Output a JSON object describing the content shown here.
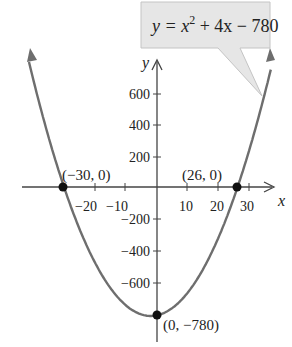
{
  "chart_data": {
    "type": "line",
    "title": "",
    "equation": "y = x^2 + 4x - 780",
    "callout": {
      "prefix": "y = x",
      "exp": "2",
      "suffix": " + 4x − 780"
    },
    "xlabel": "x",
    "ylabel": "y",
    "xlim": [
      -40,
      40
    ],
    "ylim": [
      -830,
      780
    ],
    "grid": false,
    "legend": "none",
    "x_ticks": [
      -20,
      -10,
      10,
      20,
      30
    ],
    "x_tick_labels": [
      "−20",
      "−10",
      "10",
      "20",
      "30"
    ],
    "y_ticks": [
      600,
      400,
      200,
      -200,
      -400,
      -600
    ],
    "y_tick_labels": [
      "600",
      "400",
      "200",
      "−200",
      "−400",
      "−600"
    ],
    "series": [
      {
        "name": "y = x^2 + 4x - 780",
        "function": "x^2 + 4x - 780",
        "x_range": [
          -34,
          37
        ],
        "color": "#6e6e6e"
      }
    ],
    "points": [
      {
        "x": -30,
        "y": 0,
        "label": "(−30, 0)"
      },
      {
        "x": 26,
        "y": 0,
        "label": "(26, 0)"
      },
      {
        "x": 0,
        "y": -780,
        "label": "(0, −780)"
      }
    ],
    "annotations": [
      "(−30, 0)",
      "(26, 0)",
      "(0, −780)"
    ]
  },
  "colors": {
    "curve": "#6e6e6e",
    "axis": "#444444",
    "callout_fill": "#e6e6e6",
    "callout_border": "#bdbdbd",
    "point": "#111111"
  }
}
